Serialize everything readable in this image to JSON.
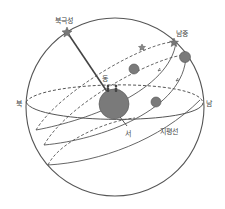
{
  "labels": {
    "polaris": "북극성",
    "culmination": "남중",
    "east": "동",
    "west": "서",
    "south": "남",
    "north": "북",
    "horizon": "지평선"
  },
  "colors": {
    "line": "#555555",
    "fill": "#7a7a7a",
    "background": "#ffffff"
  }
}
